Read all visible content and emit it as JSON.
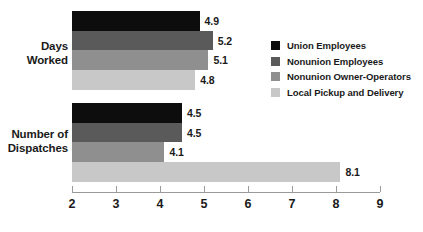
{
  "chart_data": {
    "type": "bar",
    "orientation": "horizontal",
    "title": "",
    "xlabel": "",
    "ylabel": "",
    "xlim": [
      2,
      9
    ],
    "xticks": [
      "2",
      "3",
      "4",
      "5",
      "6",
      "7",
      "8",
      "9"
    ],
    "grid": false,
    "legend_position": "top-right",
    "categories": [
      "Days\nWorked",
      "Number of\nDispatches"
    ],
    "series": [
      {
        "name": "Union Employees",
        "color": "#0d0d0d",
        "values": [
          4.9,
          4.5
        ]
      },
      {
        "name": "Nonunion Employees",
        "color": "#5a5a5a",
        "values": [
          5.2,
          4.5
        ]
      },
      {
        "name": "Nonunion Owner-Operators",
        "color": "#8f8f8f",
        "values": [
          5.1,
          4.1
        ]
      },
      {
        "name": "Local Pickup and Delivery",
        "color": "#c8c8c8",
        "values": [
          4.8,
          8.1
        ]
      }
    ],
    "value_labels": [
      [
        "4.9",
        "5.2",
        "5.1",
        "4.8"
      ],
      [
        "4.5",
        "4.5",
        "4.1",
        "8.1"
      ]
    ],
    "axis_color": "#9a9a9a",
    "text_color": "#1a1a1a",
    "background": "#ffffff"
  }
}
